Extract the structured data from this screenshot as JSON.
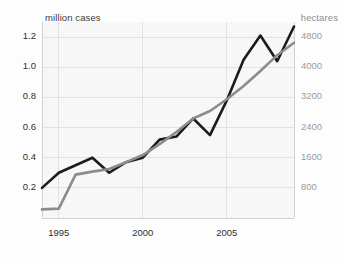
{
  "chart_data": {
    "type": "line",
    "title": "",
    "subtitle": "",
    "xlabel": "",
    "ylabel": "million cases",
    "y2label": "hectares",
    "grid": true,
    "legend_position": "none",
    "xlim": [
      1994,
      2009
    ],
    "ylim": [
      0,
      1.3
    ],
    "y2lim": [
      0,
      5200
    ],
    "xticks": [
      1995,
      2000,
      2005
    ],
    "xticklabels": [
      "1995",
      "2000",
      "2005"
    ],
    "yticks": [
      0.2,
      0.4,
      0.6,
      0.8,
      1.0,
      1.2
    ],
    "yticklabels": [
      "0.2",
      "0.4",
      "0.6",
      "0.8",
      "1.0",
      "1.2"
    ],
    "y2ticks": [
      800,
      1600,
      2400,
      3200,
      4000,
      4800
    ],
    "y2ticklabels": [
      "800",
      "1600",
      "2400",
      "3200",
      "4000",
      "4800"
    ],
    "x": [
      1994,
      1995,
      1996,
      1997,
      1998,
      1999,
      2000,
      2001,
      2002,
      2003,
      2004,
      2005,
      2006,
      2007,
      2008,
      2009
    ],
    "series": [
      {
        "name": "million cases",
        "axis": "left",
        "color": "#1c1c1c",
        "width": 2.6,
        "values": [
          0.2,
          0.3,
          0.35,
          0.4,
          0.3,
          0.37,
          0.4,
          0.52,
          0.54,
          0.66,
          0.55,
          0.78,
          1.05,
          1.21,
          1.04,
          1.27
        ]
      },
      {
        "name": "hectares",
        "axis": "right",
        "color": "#8c8c8c",
        "width": 2.6,
        "values": [
          230,
          250,
          1150,
          1230,
          1300,
          1480,
          1670,
          1960,
          2280,
          2640,
          2840,
          3150,
          3500,
          3900,
          4320,
          4650
        ]
      }
    ]
  },
  "labels": {
    "left_axis_title": "million cases",
    "right_axis_title": "hectares"
  }
}
